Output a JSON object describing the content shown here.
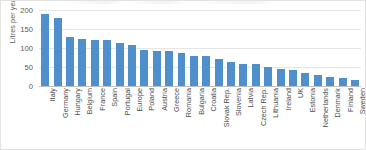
{
  "chart_data": {
    "type": "bar",
    "title": "",
    "xlabel": "",
    "ylabel": "Litres per year",
    "ylim": [
      0,
      200
    ],
    "yticks": [
      0,
      50,
      100,
      150,
      200
    ],
    "ytick_labels": [
      "0",
      "50",
      "100",
      "150",
      "200"
    ],
    "grid": true,
    "legend": false,
    "series_color": "#4e8fcc",
    "categories": [
      "Italy",
      "Germany",
      "Hungary",
      "Belgium",
      "France",
      "Spain",
      "Portugal",
      "Europe",
      "Poland",
      "Austria",
      "Greece",
      "Romania",
      "Bulgaria",
      "Croatia",
      "Slovak Rep.",
      "Slovenia",
      "Latvia",
      "Czech Rep.",
      "Lithuania",
      "Ireland",
      "UK",
      "Estonia",
      "Netherlands",
      "Denmark",
      "Finland",
      "Sweden"
    ],
    "values": [
      189,
      178,
      128,
      125,
      121,
      120,
      113,
      109,
      94,
      93,
      92,
      88,
      80,
      79,
      72,
      63,
      58,
      57,
      50,
      46,
      42,
      35,
      28,
      24,
      21,
      17
    ]
  }
}
